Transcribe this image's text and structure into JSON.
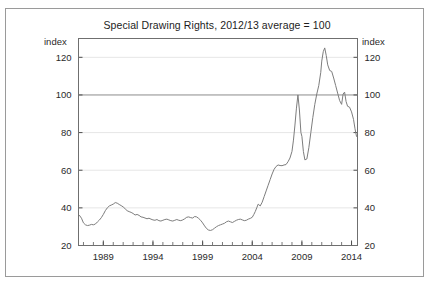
{
  "figure": {
    "title": "Special Drawing Rights, 2012/13 average = 100",
    "left_axis_unit": "index",
    "right_axis_unit": "index",
    "frame_color": "#9a9a9a",
    "background_color": "#ffffff",
    "series_color": "#7d7d7d",
    "gridline_color": "#e6e6e6",
    "reference_line_color": "#8c8c8c"
  },
  "chart_data": {
    "type": "line",
    "title": "Special Drawing Rights, 2012/13 average = 100",
    "subtitle": "",
    "xlabel": "",
    "ylabel": "index",
    "ylabel_right": "index",
    "xlim": [
      1986.5,
      2014.6
    ],
    "ylim": [
      20,
      130
    ],
    "yticks": [
      20,
      40,
      60,
      80,
      100,
      120
    ],
    "ytick_labels": [
      "20",
      "40",
      "60",
      "80",
      "100",
      "120"
    ],
    "xticks": [
      1989,
      1994,
      1999,
      2004,
      2009,
      2014
    ],
    "xtick_labels": [
      "1989",
      "1994",
      "1999",
      "2004",
      "2009",
      "2014"
    ],
    "minor_xtick_interval": 1,
    "grid": true,
    "gridlines_at": [
      40,
      60,
      80,
      120
    ],
    "reference_line_at": 100,
    "legend": null,
    "legend_position": "none",
    "annotations": [],
    "series": [
      {
        "name": "Special Drawing Rights index",
        "x": [
          1986.6,
          1986.8,
          1987.0,
          1987.2,
          1987.4,
          1987.6,
          1987.8,
          1988.0,
          1988.2,
          1988.4,
          1988.6,
          1988.8,
          1989.0,
          1989.2,
          1989.4,
          1989.6,
          1989.8,
          1990.0,
          1990.2,
          1990.4,
          1990.6,
          1990.8,
          1991.0,
          1991.2,
          1991.4,
          1991.6,
          1991.8,
          1992.0,
          1992.2,
          1992.4,
          1992.6,
          1992.8,
          1993.0,
          1993.2,
          1993.4,
          1993.6,
          1993.8,
          1994.0,
          1994.2,
          1994.4,
          1994.6,
          1994.8,
          1995.0,
          1995.2,
          1995.4,
          1995.6,
          1995.8,
          1996.0,
          1996.2,
          1996.4,
          1996.6,
          1996.8,
          1997.0,
          1997.2,
          1997.4,
          1997.6,
          1997.8,
          1998.0,
          1998.2,
          1998.4,
          1998.6,
          1998.8,
          1999.0,
          1999.2,
          1999.4,
          1999.6,
          1999.8,
          2000.0,
          2000.2,
          2000.4,
          2000.6,
          2000.8,
          2001.0,
          2001.2,
          2001.4,
          2001.6,
          2001.8,
          2002.0,
          2002.2,
          2002.4,
          2002.6,
          2002.8,
          2003.0,
          2003.2,
          2003.4,
          2003.6,
          2003.8,
          2004.0,
          2004.15,
          2004.3,
          2004.45,
          2004.6,
          2004.8,
          2005.0,
          2005.2,
          2005.4,
          2005.6,
          2005.8,
          2006.0,
          2006.2,
          2006.4,
          2006.6,
          2006.8,
          2007.0,
          2007.2,
          2007.4,
          2007.6,
          2007.8,
          2008.0,
          2008.15,
          2008.3,
          2008.45,
          2008.6,
          2008.75,
          2008.9,
          2009.0,
          2009.15,
          2009.3,
          2009.5,
          2009.7,
          2009.9,
          2010.1,
          2010.3,
          2010.5,
          2010.7,
          2010.9,
          2011.0,
          2011.15,
          2011.3,
          2011.45,
          2011.6,
          2011.8,
          2012.0,
          2012.2,
          2012.4,
          2012.6,
          2012.8,
          2013.0,
          2013.15,
          2013.3,
          2013.45,
          2013.6,
          2013.8,
          2014.0,
          2014.2,
          2014.35,
          2014.5
        ],
        "values": [
          36.0,
          34.5,
          32.0,
          31.0,
          30.6,
          30.8,
          31.2,
          31.0,
          31.4,
          32.5,
          33.5,
          34.8,
          36.5,
          38.5,
          40.0,
          41.0,
          41.5,
          42.0,
          42.8,
          42.5,
          41.8,
          41.2,
          40.5,
          39.5,
          38.5,
          38.0,
          37.6,
          37.0,
          36.2,
          36.5,
          36.0,
          35.2,
          35.0,
          34.6,
          34.2,
          34.5,
          34.0,
          33.6,
          33.4,
          33.8,
          33.2,
          33.0,
          33.4,
          33.8,
          34.0,
          33.6,
          33.2,
          33.0,
          33.4,
          33.8,
          33.4,
          33.2,
          33.6,
          34.2,
          35.0,
          35.2,
          34.8,
          34.6,
          35.4,
          35.2,
          34.4,
          33.4,
          32.0,
          30.4,
          29.0,
          28.2,
          28.0,
          28.4,
          29.2,
          30.0,
          30.6,
          31.0,
          31.4,
          31.8,
          32.6,
          33.0,
          32.6,
          32.2,
          32.8,
          33.4,
          33.8,
          34.0,
          33.6,
          33.2,
          33.4,
          34.0,
          34.4,
          35.0,
          36.4,
          38.0,
          40.0,
          42.0,
          41.0,
          43.0,
          46.0,
          49.0,
          52.0,
          55.0,
          58.0,
          60.5,
          62.0,
          62.8,
          62.5,
          62.4,
          62.8,
          63.0,
          64.5,
          66.5,
          70.0,
          76.0,
          84.0,
          93.0,
          100.0,
          92.0,
          80.0,
          78.0,
          70.0,
          65.5,
          66.0,
          72.0,
          80.0,
          88.0,
          95.0,
          100.5,
          105.0,
          112.0,
          118.0,
          123.0,
          125.0,
          121.0,
          116.0,
          113.0,
          112.5,
          109.0,
          105.0,
          101.0,
          97.0,
          95.0,
          100.5,
          101.5,
          96.5,
          94.0,
          93.5,
          91.0,
          87.0,
          82.0,
          78.0
        ]
      }
    ]
  }
}
